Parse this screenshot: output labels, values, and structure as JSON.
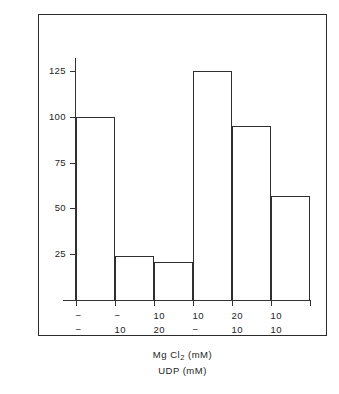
{
  "chart_data": {
    "type": "bar",
    "title": "",
    "subtitle": "",
    "xlabel_lines": [
      "Mg Cl2  (mM)",
      "UDP  (mM)"
    ],
    "ylabel": "Per cent activity",
    "ylim": [
      0,
      135
    ],
    "yticks": [
      25,
      50,
      75,
      100,
      125
    ],
    "ytick_labels": [
      "25",
      "50",
      "75",
      "100",
      "125"
    ],
    "grid": false,
    "legend": null,
    "categories": [
      "1",
      "2",
      "3",
      "4",
      "5",
      "6"
    ],
    "values": [
      100,
      24,
      21,
      125,
      95,
      57
    ],
    "group_labels": {
      "row1_name": "MgCl2 (mM)",
      "row2_name": "UDP (mM)",
      "row1": [
        "−",
        "−",
        "10",
        "10",
        "20",
        "10"
      ],
      "row2": [
        "−",
        "10",
        "20",
        "−",
        "10",
        "10"
      ]
    },
    "bar_style": {
      "fill": "#ffffff",
      "edge": "#2f2f2f"
    }
  },
  "axis": {
    "y_title": "Per cent activity",
    "ticks": [
      {
        "label": "125",
        "value": 125
      },
      {
        "label": "100",
        "value": 100
      },
      {
        "label": "75",
        "value": 75
      },
      {
        "label": "50",
        "value": 50
      },
      {
        "label": "25",
        "value": 25
      }
    ]
  },
  "captions": {
    "line1_pre": "Mg Cl",
    "line1_sub": "2",
    "line1_post": "  (mM)",
    "line2": "UDP  (mM)"
  },
  "colors": {
    "frame": "#2b2b2b",
    "axis": "#333333",
    "bar_edge": "#2f2f2f",
    "bar_fill": "#ffffff",
    "text": "#242424",
    "background": "#ffffff"
  }
}
